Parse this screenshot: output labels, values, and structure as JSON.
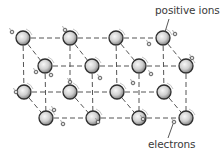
{
  "diagram": {
    "labels": {
      "positive_ions": "positive ions",
      "electrons": "electrons"
    },
    "colors": {
      "background": "#ffffff",
      "lattice_line": "#555555",
      "ion_outline": "#2e2e2e",
      "ion_fill_light": "#f2f2f2",
      "ion_fill_dark": "#8a8a8a",
      "electron": "#444444",
      "text": "#3a3a3a"
    },
    "ions": [
      {
        "row": "back-top",
        "x": 23,
        "y": 38
      },
      {
        "row": "back-top",
        "x": 70,
        "y": 38
      },
      {
        "row": "back-top",
        "x": 116,
        "y": 38
      },
      {
        "row": "back-top",
        "x": 163,
        "y": 38
      },
      {
        "row": "front-top",
        "x": 45,
        "y": 66
      },
      {
        "row": "front-top",
        "x": 92,
        "y": 66
      },
      {
        "row": "front-top",
        "x": 139,
        "y": 66
      },
      {
        "row": "front-top",
        "x": 186,
        "y": 66
      },
      {
        "row": "back-bottom",
        "x": 24,
        "y": 92
      },
      {
        "row": "back-bottom",
        "x": 70,
        "y": 92
      },
      {
        "row": "back-bottom",
        "x": 117,
        "y": 92
      },
      {
        "row": "back-bottom",
        "x": 164,
        "y": 92
      },
      {
        "row": "front-bottom",
        "x": 46,
        "y": 118
      },
      {
        "row": "front-bottom",
        "x": 93,
        "y": 118
      },
      {
        "row": "front-bottom",
        "x": 139,
        "y": 118
      },
      {
        "row": "front-bottom",
        "x": 186,
        "y": 118
      }
    ],
    "electrons": [
      {
        "x": 12,
        "y": 32
      },
      {
        "x": 65,
        "y": 30
      },
      {
        "x": 149,
        "y": 44
      },
      {
        "x": 175,
        "y": 34
      },
      {
        "x": 36,
        "y": 72
      },
      {
        "x": 51,
        "y": 75
      },
      {
        "x": 70,
        "y": 82
      },
      {
        "x": 100,
        "y": 78
      },
      {
        "x": 151,
        "y": 74
      },
      {
        "x": 133,
        "y": 83
      },
      {
        "x": 192,
        "y": 58
      },
      {
        "x": 16,
        "y": 92
      },
      {
        "x": 54,
        "y": 110
      },
      {
        "x": 63,
        "y": 124
      },
      {
        "x": 143,
        "y": 119
      },
      {
        "x": 174,
        "y": 122
      },
      {
        "x": 98,
        "y": 122
      }
    ],
    "pointers": {
      "positive_ions": {
        "x1": 169,
        "y1": 19,
        "x2": 165,
        "y2": 32
      },
      "electrons": {
        "x1": 173,
        "y1": 124,
        "x2": 168,
        "y2": 138
      }
    }
  }
}
